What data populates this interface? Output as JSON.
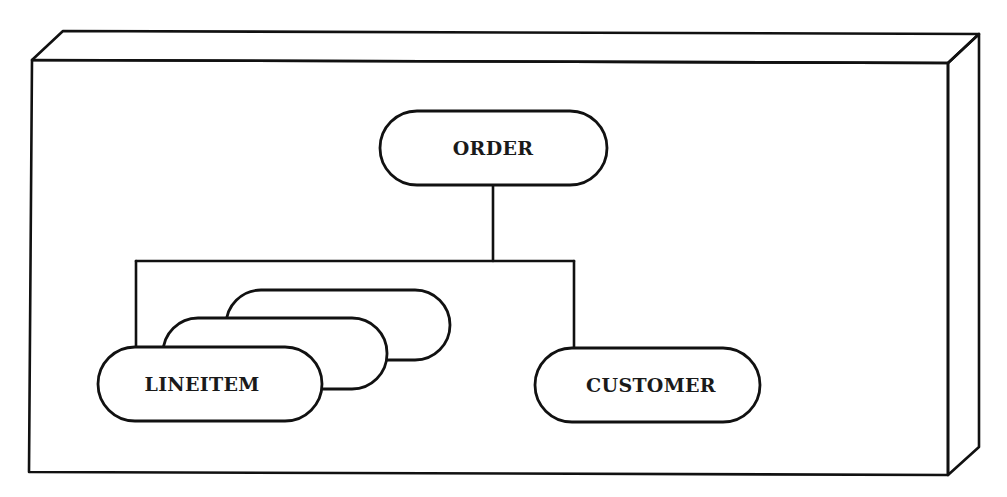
{
  "diagram": {
    "type": "hierarchy",
    "container": "3d-box-frame",
    "colors": {
      "stroke": "#111111",
      "background": "#ffffff",
      "text": "#1a1a1a"
    },
    "nodes": {
      "order": {
        "label": "ORDER"
      },
      "lineitem": {
        "label": "LINEITEM",
        "stacked": true,
        "stack_count": 3
      },
      "customer": {
        "label": "CUSTOMER"
      }
    },
    "edges": [
      {
        "from": "ORDER",
        "to": "LINEITEM",
        "cardinality": "many"
      },
      {
        "from": "ORDER",
        "to": "CUSTOMER",
        "cardinality": "one"
      }
    ]
  }
}
